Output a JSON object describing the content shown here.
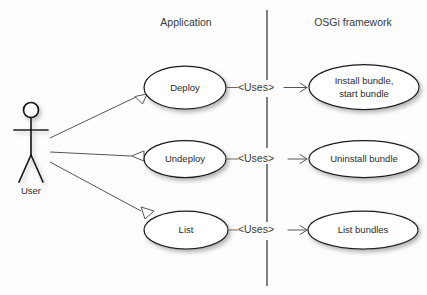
{
  "diagram": {
    "background_color": "#fdfdfd",
    "columns": [
      {
        "id": "application",
        "label": "Application"
      },
      {
        "id": "osgi",
        "label": "OSGi framework"
      }
    ],
    "actor": {
      "label": "User",
      "icon": "stick-figure-actor-icon"
    },
    "relationship_label": "<Uses>",
    "rows": [
      {
        "id": "deploy",
        "left_use_case": {
          "lines": [
            "Deploy"
          ]
        },
        "relationship": "<Uses>",
        "right_use_case": {
          "lines": [
            "Install bundle,",
            "start bundle"
          ]
        }
      },
      {
        "id": "undeploy",
        "left_use_case": {
          "lines": [
            "Undeploy"
          ]
        },
        "relationship": "<Uses>",
        "right_use_case": {
          "lines": [
            "Uninstall bundle"
          ]
        }
      },
      {
        "id": "list",
        "left_use_case": {
          "lines": [
            "List"
          ]
        },
        "relationship": "<Uses>",
        "right_use_case": {
          "lines": [
            "List bundles"
          ]
        }
      }
    ],
    "colors": {
      "stroke": "#1a1a1a",
      "text": "#2b2b2b",
      "header_text": "#3a3a3a",
      "connector": "#555555",
      "divider": "#4a4a4a",
      "shape_fill": "#ffffff"
    }
  }
}
